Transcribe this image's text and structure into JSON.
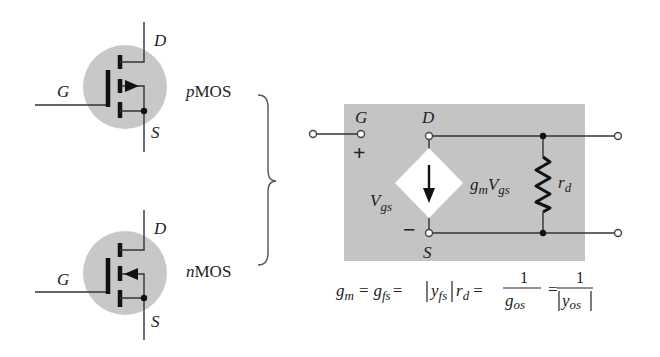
{
  "figure": {
    "colors": {
      "background": "#ffffff",
      "device_circle": "#c8c8c8",
      "model_box": "#c4c4c4",
      "source_diamond": "#ffffff",
      "ink": "#222222"
    }
  },
  "pmos": {
    "type_label_prefix": "p",
    "type_label_suffix": "MOS",
    "gate_label": "G",
    "drain_label": "D",
    "source_label": "S",
    "arrow_direction": "outward"
  },
  "nmos": {
    "type_label_prefix": "n",
    "type_label_suffix": "MOS",
    "gate_label": "G",
    "drain_label": "D",
    "source_label": "S",
    "arrow_direction": "inward"
  },
  "equivalent": {
    "gate_label": "G",
    "drain_label": "D",
    "source_label": "S",
    "plus_sign": "+",
    "minus_sign": "−",
    "vgs_main": "V",
    "vgs_sub": "gs",
    "current_source_g": "g",
    "current_source_g_sub": "m",
    "current_source_v": "V",
    "current_source_v_sub": "gs",
    "resistor_main": "r",
    "resistor_sub": "d"
  },
  "equation": {
    "gm": "g",
    "gm_sub": "m",
    "eq1": "=",
    "gfs": "g",
    "gfs_sub": "fs",
    "eq2": "=",
    "yfs": "y",
    "yfs_sub": "fs",
    "rd": "r",
    "rd_sub": "d",
    "eq3": "=",
    "frac1_num": "1",
    "frac1_den": "g",
    "frac1_den_sub": "os",
    "eq4": "=",
    "frac2_num": "1",
    "frac2_den": "y",
    "frac2_den_sub": "os"
  }
}
